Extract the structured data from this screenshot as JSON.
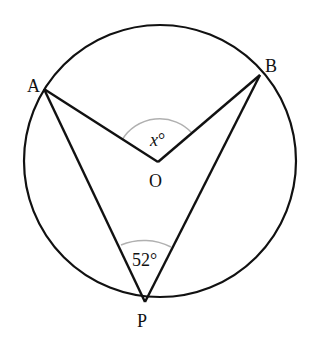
{
  "diagram": {
    "type": "circle-geometry",
    "points": {
      "A": {
        "label": "A",
        "x": 44,
        "y": 89
      },
      "B": {
        "label": "B",
        "x": 260,
        "y": 75
      },
      "O": {
        "label": "O",
        "x": 158,
        "y": 162
      },
      "P": {
        "label": "P",
        "x": 145,
        "y": 302
      }
    },
    "circle": {
      "cx": 160,
      "cy": 161,
      "r": 136
    },
    "angles": {
      "central": {
        "vertex": "O",
        "label_var": "x",
        "label_deg": "°",
        "text": "x°"
      },
      "inscribed": {
        "vertex": "P",
        "text": "52°"
      }
    },
    "colors": {
      "stroke": "#111111",
      "arc": "#b0b0b0",
      "background": "#ffffff"
    }
  }
}
